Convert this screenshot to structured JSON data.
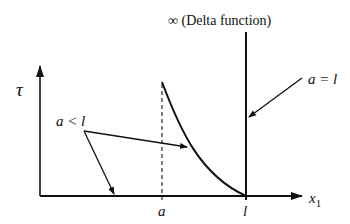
{
  "diagram": {
    "y_axis_label": "τ",
    "x_axis_label": "x",
    "x_axis_subscript": "1",
    "tick_a": "a",
    "tick_l": "l",
    "delta_label": "∞ (Delta function)",
    "label_a_less_l": "a < l",
    "label_a_equals_l": "a = l"
  }
}
